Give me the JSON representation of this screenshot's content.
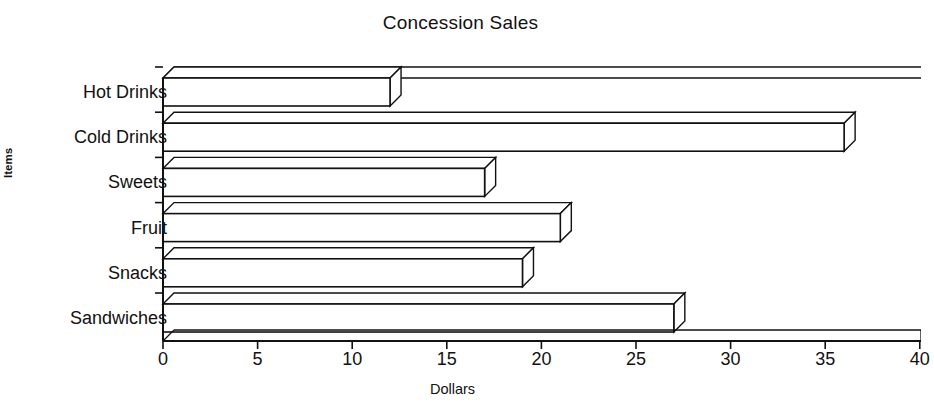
{
  "chart_data": {
    "type": "bar",
    "orientation": "horizontal",
    "style": "3d-line-art",
    "title": "Concession Sales",
    "xlabel": "Dollars",
    "ylabel": "Items",
    "categories": [
      "Hot Drinks",
      "Cold Drinks",
      "Sweets",
      "Fruit",
      "Snacks",
      "Sandwiches"
    ],
    "values": [
      12,
      36,
      17,
      21,
      19,
      27
    ],
    "series": [
      {
        "name": "Dollars",
        "values": [
          12,
          36,
          17,
          21,
          19,
          27
        ]
      }
    ],
    "xlim": [
      0,
      40
    ],
    "xticks": [
      0,
      5,
      10,
      15,
      20,
      25,
      30,
      35,
      40
    ],
    "xtick_labels": [
      "0",
      "5",
      "10",
      "15",
      "20",
      "25",
      "30",
      "35",
      "40"
    ],
    "grid": false,
    "legend": false,
    "legend_position": "none",
    "colors": {
      "bar_fill": "#ffffff",
      "bar_stroke": "#111111",
      "axis": "#111111",
      "text": "#111111",
      "background": "#ffffff"
    }
  },
  "labels": {
    "title": "Concession Sales",
    "x_axis": "Dollars",
    "y_axis": "Items"
  }
}
